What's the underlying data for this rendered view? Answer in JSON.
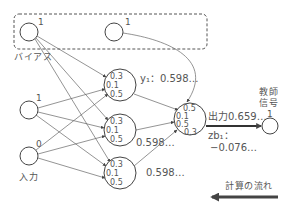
{
  "diagram": {
    "bias_group_label": "バイアス",
    "input_group_label": "入力",
    "bias_nodes": [
      {
        "value": "1"
      },
      {
        "value": "1"
      }
    ],
    "input_nodes": [
      {
        "value": "1"
      },
      {
        "value": "0"
      }
    ],
    "hidden_nodes": [
      {
        "weights": [
          "0.3",
          "0.1",
          "0.5"
        ],
        "output_label": "y₁：0.598…"
      },
      {
        "weights": [
          "0.3",
          "0.1",
          "0.5"
        ],
        "output_label": "0.598…"
      },
      {
        "weights": [
          "0.3",
          "0.1",
          "0.5"
        ],
        "output_label": "0.598…"
      }
    ],
    "output_node": {
      "weights": [
        "0.5",
        "0.1",
        "0.5",
        "0.3"
      ],
      "output_label": "出力0.659…",
      "zb_label": "zb₁：",
      "zb_value": "−0.076…"
    },
    "teacher": {
      "label_line1": "教師",
      "label_line2": "信号",
      "value": "1"
    },
    "flow_label": "計算の流れ",
    "colors": {
      "stroke": "#555555",
      "node_stroke": "#444444",
      "arrow": "#444444",
      "text": "#555555"
    }
  }
}
